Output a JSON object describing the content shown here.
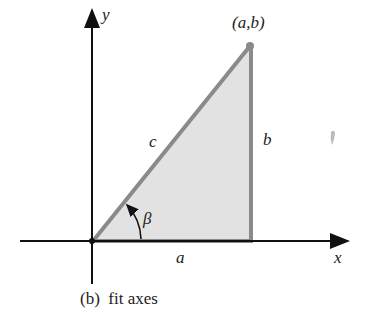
{
  "diagram": {
    "axes": {
      "x_label": "x",
      "y_label": "y"
    },
    "vertex_label": "(a,b)",
    "sides": {
      "hypotenuse": "c",
      "vertical": "b",
      "horizontal": "a"
    },
    "angle_label": "β",
    "caption": "(b)  fit axes",
    "colors": {
      "fill": "#e2e2e2",
      "edge": "#8a8a8a",
      "axis": "#111111"
    }
  }
}
